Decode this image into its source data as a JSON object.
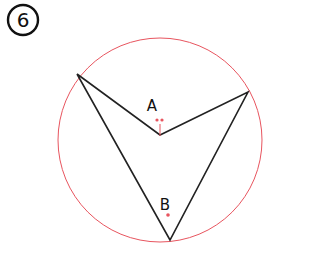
{
  "problem_number": "6",
  "labels": {
    "point_a": "A",
    "point_b": "B"
  },
  "colors": {
    "circle": "#e8555f",
    "lines": "#222222",
    "marks": "#e8555f",
    "text": "#111111"
  }
}
